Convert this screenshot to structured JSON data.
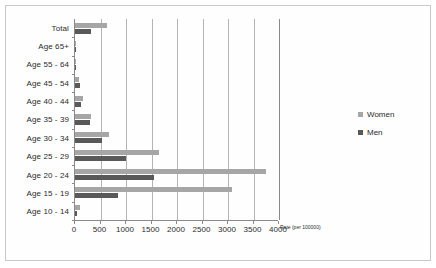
{
  "chart_data": {
    "type": "bar",
    "orientation": "horizontal",
    "title": "",
    "xlabel": "Rate (per 100000)",
    "ylabel": "",
    "xlim": [
      0,
      4000
    ],
    "xticks": [
      0,
      500,
      1000,
      1500,
      2000,
      2500,
      3000,
      3500,
      4000
    ],
    "xtick_labels": [
      "0",
      "500",
      "1000",
      "1500",
      "2000",
      "2500",
      "3000",
      "3500",
      "4000"
    ],
    "grid": true,
    "legend_position": "right",
    "categories": [
      "Total",
      "Age 65+",
      "Age 55 - 64",
      "Age 45 - 54",
      "Age 40 - 44",
      "Age 35 - 39",
      "Age 30 - 34",
      "Age 25 - 29",
      "Age 20 - 24",
      "Age 15 - 19",
      "Age 10 - 14"
    ],
    "series": [
      {
        "name": "Women",
        "color": "#a6a6a6",
        "values": [
          620,
          15,
          20,
          70,
          150,
          310,
          660,
          1650,
          3750,
          3080,
          90
        ]
      },
      {
        "name": "Men",
        "color": "#595959",
        "values": [
          310,
          5,
          10,
          100,
          110,
          285,
          530,
          1000,
          1550,
          850,
          30
        ]
      }
    ]
  },
  "legend": {
    "items": [
      {
        "label": "Women",
        "swatch": "women"
      },
      {
        "label": "Men",
        "swatch": "men"
      }
    ]
  },
  "colors": {
    "women": "#a6a6a6",
    "men": "#595959",
    "gridline": "#b4b4b4",
    "axis": "#8a8a8a",
    "text": "#2b2b2b",
    "frame": "#c8c8c8",
    "background": "#ffffff"
  }
}
